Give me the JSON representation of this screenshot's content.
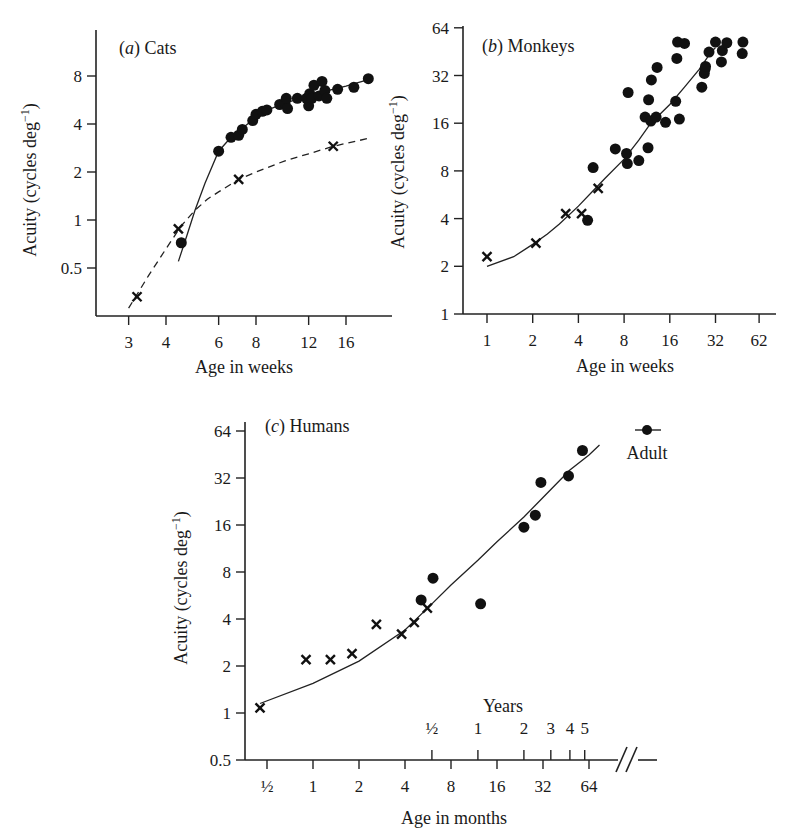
{
  "chart_data": [
    {
      "id": "cats",
      "type": "scatter",
      "title": "(a) Cats",
      "panel_letter": "a",
      "panel_name": "Cats",
      "xlabel": "Age in weeks",
      "ylabel": "Acuity (cycles deg⁻¹)",
      "xscale": "log2",
      "yscale": "log2",
      "xticks": [
        3,
        4,
        6,
        8,
        12,
        16
      ],
      "yticks": [
        0.5,
        1,
        2,
        4,
        8
      ],
      "xlim": [
        2.6,
        21
      ],
      "ylim": [
        0.27,
        14
      ],
      "series": [
        {
          "name": "behavioral (dots)",
          "marker": "dot",
          "points": [
            [
              4.5,
              0.72
            ],
            [
              6.0,
              2.7
            ],
            [
              6.6,
              3.3
            ],
            [
              7.0,
              3.4
            ],
            [
              7.2,
              3.7
            ],
            [
              7.8,
              4.2
            ],
            [
              8.0,
              4.6
            ],
            [
              8.4,
              4.8
            ],
            [
              8.7,
              4.9
            ],
            [
              9.6,
              5.3
            ],
            [
              10.0,
              5.4
            ],
            [
              10.1,
              5.8
            ],
            [
              10.2,
              5.0
            ],
            [
              11.0,
              5.8
            ],
            [
              11.8,
              5.8
            ],
            [
              12.0,
              5.2
            ],
            [
              12.1,
              6.2
            ],
            [
              12.3,
              5.8
            ],
            [
              12.5,
              7.0
            ],
            [
              13.0,
              6.0
            ],
            [
              13.3,
              7.4
            ],
            [
              13.6,
              6.5
            ],
            [
              13.8,
              5.8
            ],
            [
              15.0,
              6.6
            ],
            [
              17.0,
              6.8
            ],
            [
              19.0,
              7.7
            ]
          ]
        },
        {
          "name": "electrophysiological (crosses)",
          "marker": "cross",
          "points": [
            [
              3.2,
              0.33
            ],
            [
              4.4,
              0.88
            ],
            [
              7.0,
              1.8
            ],
            [
              14.5,
              2.9
            ]
          ]
        }
      ],
      "fits": [
        {
          "name": "solid fit",
          "style": "solid",
          "points": [
            [
              4.4,
              0.55
            ],
            [
              4.7,
              0.8
            ],
            [
              5.0,
              1.15
            ],
            [
              5.4,
              1.7
            ],
            [
              6.0,
              2.7
            ],
            [
              6.6,
              3.3
            ],
            [
              7.5,
              4.0
            ],
            [
              8.5,
              4.8
            ],
            [
              10,
              5.4
            ],
            [
              12,
              6.0
            ],
            [
              14,
              6.5
            ],
            [
              16,
              6.9
            ],
            [
              19,
              7.6
            ]
          ]
        },
        {
          "name": "dashed fit",
          "style": "dashed",
          "points": [
            [
              3.0,
              0.28
            ],
            [
              3.5,
              0.45
            ],
            [
              4.0,
              0.66
            ],
            [
              4.5,
              0.92
            ],
            [
              5.0,
              1.15
            ],
            [
              5.5,
              1.35
            ],
            [
              6.0,
              1.5
            ],
            [
              7.0,
              1.8
            ],
            [
              8.0,
              2.0
            ],
            [
              10,
              2.35
            ],
            [
              12,
              2.6
            ],
            [
              14.5,
              2.9
            ],
            [
              19,
              3.25
            ]
          ]
        }
      ]
    },
    {
      "id": "monkeys",
      "type": "scatter",
      "title": "(b) Monkeys",
      "panel_letter": "b",
      "panel_name": "Monkeys",
      "xlabel": "Age in weeks",
      "ylabel": "Acuity (cycles deg⁻¹)",
      "xscale": "log2",
      "yscale": "log2",
      "xticks": [
        1,
        2,
        4,
        8,
        16,
        32,
        62
      ],
      "xtick_labels": [
        "1",
        "2",
        "4",
        "8",
        "16",
        "32",
        "62"
      ],
      "yticks": [
        1,
        2,
        4,
        8,
        16,
        32,
        64
      ],
      "xlim": [
        0.7,
        75
      ],
      "ylim": [
        1,
        64
      ],
      "series": [
        {
          "name": "behavioral (dots)",
          "marker": "dot",
          "points": [
            [
              4.6,
              3.9
            ],
            [
              5.0,
              8.4
            ],
            [
              7.0,
              11.0
            ],
            [
              8.3,
              10.3
            ],
            [
              8.4,
              8.9
            ],
            [
              8.5,
              25.0
            ],
            [
              10.0,
              9.3
            ],
            [
              11.0,
              17.5
            ],
            [
              11.5,
              11.2
            ],
            [
              11.6,
              22.5
            ],
            [
              12.0,
              16.5
            ],
            [
              12.1,
              30.0
            ],
            [
              13.0,
              17.5
            ],
            [
              13.2,
              36.0
            ],
            [
              15.0,
              16.2
            ],
            [
              17.5,
              22.0
            ],
            [
              17.8,
              41.0
            ],
            [
              18.0,
              52.0
            ],
            [
              18.5,
              17.0
            ],
            [
              20.0,
              51.0
            ],
            [
              26.0,
              27.0
            ],
            [
              27.0,
              33.0
            ],
            [
              27.3,
              35.0
            ],
            [
              27.5,
              36.5
            ],
            [
              29.0,
              45.0
            ],
            [
              32.0,
              52.0
            ],
            [
              35.0,
              39.0
            ],
            [
              35.5,
              46.0
            ],
            [
              38.0,
              51.5
            ],
            [
              48.0,
              44.0
            ],
            [
              48.5,
              52.0
            ]
          ]
        },
        {
          "name": "electrophysiological (crosses)",
          "marker": "cross",
          "points": [
            [
              1.0,
              2.3
            ],
            [
              2.1,
              2.8
            ],
            [
              3.3,
              4.3
            ],
            [
              4.2,
              4.3
            ],
            [
              5.4,
              6.2
            ]
          ]
        }
      ],
      "fits": [
        {
          "name": "solid fit",
          "style": "solid",
          "points": [
            [
              1.0,
              2.0
            ],
            [
              1.5,
              2.3
            ],
            [
              2.0,
              2.75
            ],
            [
              2.5,
              3.2
            ],
            [
              3.0,
              3.7
            ],
            [
              4.0,
              4.8
            ],
            [
              5.0,
              6.0
            ],
            [
              6.0,
              7.2
            ],
            [
              8.0,
              9.5
            ],
            [
              10,
              12.5
            ],
            [
              12,
              16
            ],
            [
              16,
              21
            ],
            [
              20,
              27
            ],
            [
              25,
              35
            ],
            [
              30,
              45
            ],
            [
              32,
              48
            ]
          ]
        }
      ]
    },
    {
      "id": "humans",
      "type": "scatter",
      "title": "(c) Humans",
      "panel_letter": "c",
      "panel_name": "Humans",
      "xlabel": "Age in months",
      "ylabel": "Acuity (cycles deg⁻¹)",
      "secondary_xlabel": "Years",
      "xscale": "log2",
      "yscale": "log2",
      "xticks": [
        0.5,
        1,
        2,
        4,
        8,
        16,
        32,
        64
      ],
      "xtick_labels": [
        "½",
        "1",
        "2",
        "4",
        "8",
        "16",
        "32",
        "64"
      ],
      "year_ticks_months": [
        6,
        12,
        24,
        36,
        48,
        60
      ],
      "year_tick_labels": [
        "½",
        "1",
        "2",
        "3",
        "4",
        "5"
      ],
      "yticks": [
        0.5,
        1,
        2,
        4,
        8,
        16,
        32,
        64
      ],
      "xlim": [
        0.4,
        110
      ],
      "ylim": [
        0.5,
        64
      ],
      "axis_break": true,
      "annotation": "Adult",
      "series": [
        {
          "name": "behavioral (dots)",
          "marker": "dot",
          "points": [
            [
              5.1,
              5.3
            ],
            [
              6.1,
              7.3
            ],
            [
              12.5,
              5.0
            ],
            [
              24.0,
              15.5
            ],
            [
              28.5,
              18.5
            ],
            [
              31.0,
              30.0
            ],
            [
              47.0,
              33.0
            ],
            [
              58.0,
              48.0
            ]
          ]
        },
        {
          "name": "electrophysiological (crosses)",
          "marker": "cross",
          "points": [
            [
              0.45,
              1.08
            ],
            [
              0.9,
              2.2
            ],
            [
              1.3,
              2.2
            ],
            [
              1.8,
              2.4
            ],
            [
              2.6,
              3.7
            ],
            [
              3.8,
              3.2
            ],
            [
              4.6,
              3.8
            ],
            [
              5.6,
              4.7
            ]
          ]
        }
      ],
      "adult_marker": {
        "marker": "dot"
      },
      "fits": [
        {
          "name": "solid fit",
          "style": "solid",
          "points": [
            [
              0.45,
              1.15
            ],
            [
              1.0,
              1.55
            ],
            [
              2.0,
              2.15
            ],
            [
              4.0,
              3.4
            ],
            [
              6.0,
              5.0
            ],
            [
              8.0,
              6.6
            ],
            [
              12,
              9.5
            ],
            [
              16,
              12.5
            ],
            [
              24,
              18
            ],
            [
              32,
              24
            ],
            [
              48,
              36
            ],
            [
              64,
              45
            ],
            [
              75,
              52
            ]
          ]
        }
      ]
    }
  ]
}
